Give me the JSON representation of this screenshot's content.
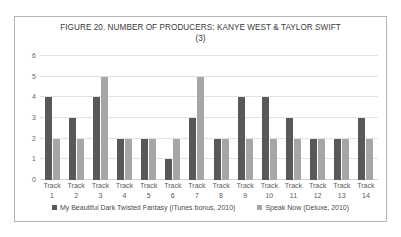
{
  "chart_data": {
    "type": "bar",
    "title": "FIGURE 20. NUMBER OF PRODUCERS: KANYE WEST & TAYLOR SWIFT (3)",
    "title_line1": "FIGURE 20. NUMBER OF PRODUCERS: KANYE WEST & TAYLOR SWIFT",
    "title_line2": "(3)",
    "xlabel": "",
    "ylabel": "",
    "ylim": [
      0,
      6
    ],
    "yticks": [
      6,
      5,
      4,
      3,
      2,
      1,
      0
    ],
    "grid": true,
    "legend_position": "bottom",
    "categories": [
      "Track 1",
      "Track 2",
      "Track 3",
      "Track 4",
      "Track 5",
      "Track 6",
      "Track 7",
      "Track 8",
      "Track 9",
      "Track 10",
      "Track 11",
      "Track 12",
      "Track 13",
      "Track 14"
    ],
    "category_prefix": "Track",
    "category_numbers": [
      "1",
      "2",
      "3",
      "4",
      "5",
      "6",
      "7",
      "8",
      "9",
      "10",
      "11",
      "12",
      "13",
      "14"
    ],
    "series": [
      {
        "name": "My Beautiful Dark Twisted Fantasy (iTunes bonus, 2010)",
        "color": "#595959",
        "values": [
          4,
          3,
          4,
          2,
          2,
          1,
          3,
          2,
          4,
          4,
          3,
          2,
          2,
          3
        ]
      },
      {
        "name": "Speak Now (Deluxe, 2010)",
        "color": "#a6a6a6",
        "values": [
          2,
          2,
          5,
          2,
          2,
          2,
          5,
          2,
          2,
          2,
          2,
          2,
          2,
          2
        ]
      }
    ]
  }
}
